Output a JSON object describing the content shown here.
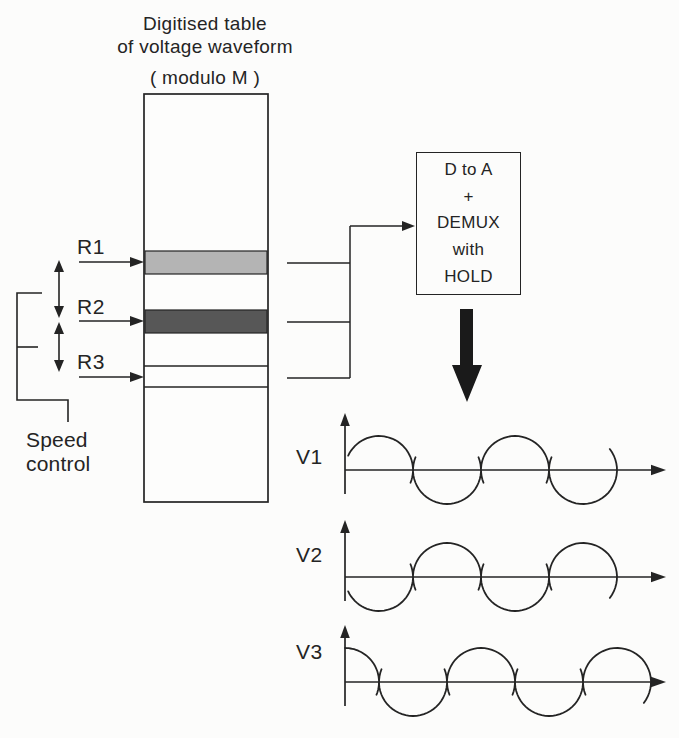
{
  "title": {
    "line1": "Digitised table",
    "line2": "of voltage waveform",
    "line3": "( modulo M )"
  },
  "pointers": [
    {
      "label": "R1"
    },
    {
      "label": "R2"
    },
    {
      "label": "R3"
    }
  ],
  "speed_control_label": "Speed control",
  "converter_box": {
    "lines": [
      "D to A",
      "+",
      "DEMUX",
      "with",
      "HOLD"
    ]
  },
  "waveforms": [
    {
      "label": "V1",
      "start": "zero",
      "first": "up"
    },
    {
      "label": "V2",
      "start": "zero",
      "first": "down"
    },
    {
      "label": "V3",
      "start": "peak",
      "first": "up"
    }
  ],
  "colors": {
    "ink": "#242424",
    "band_light": "#b4b4b4",
    "band_dark": "#575757",
    "paper": "#fcfcfb"
  }
}
